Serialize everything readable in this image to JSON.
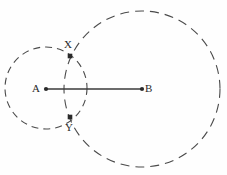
{
  "figure": {
    "width": 227,
    "height": 175,
    "background_color": "#fefefe",
    "stroke_color": "#4a4a4a",
    "line_color": "#3a3a3a",
    "dot_color": "#2a2a2a",
    "label_color": "#2a2a2a",
    "circles": [
      {
        "name": "small-circle",
        "center_label": "A",
        "cx": 46,
        "cy": 88,
        "r": 41,
        "style": "dashed",
        "dash_pattern": "7 5"
      },
      {
        "name": "large-circle",
        "center_label": "B",
        "cx": 142,
        "cy": 89,
        "r": 78,
        "style": "dashed",
        "dash_pattern": "9 6"
      }
    ],
    "segment": {
      "name": "segment-ab",
      "from": "A",
      "to": "B",
      "x1": 46,
      "y1": 89,
      "x2": 142,
      "y2": 89
    },
    "points": [
      {
        "id": "A",
        "label": "A",
        "x": 46,
        "y": 89,
        "label_position": "left"
      },
      {
        "id": "B",
        "label": "B",
        "x": 142,
        "y": 89,
        "label_position": "right"
      },
      {
        "id": "X",
        "label": "X",
        "x": 70,
        "y": 56,
        "label_position": "above"
      },
      {
        "id": "Y",
        "label": "Y",
        "x": 70,
        "y": 117,
        "label_position": "below"
      }
    ]
  }
}
